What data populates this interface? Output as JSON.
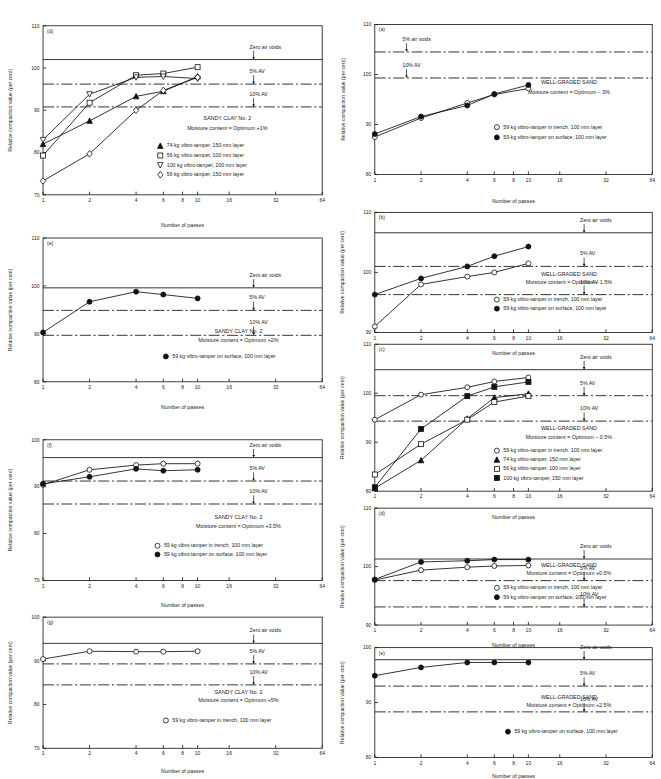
{
  "figure": {
    "axis_labels": {
      "x": "Number of passes",
      "y": "Relative compaction value (per cent)"
    },
    "xticks": [
      "1",
      "2",
      "4",
      "6",
      "8",
      "10",
      "16",
      "32",
      "64"
    ],
    "annotations": {
      "zero_air_voids": "Zero air voids",
      "five_pct_av": "5% AV",
      "ten_pct_av": "10% AV",
      "five_pct_air_voids": "5% air voids"
    },
    "legend_labels": {
      "trench59": "59 kg vibro-tamper in trench, 100 mm layer",
      "surface59": "59 kg vibro-tamper on surface, 100 mm layer",
      "t74": "74 kg vibro-tamper, 150 mm layer",
      "t56_100": "56 kg vibro-tamper, 100 mm layer",
      "t56_150": "56 kg vibro-tamper, 150 mm layer",
      "t100_200": "100 kg vibro-tamper, 200 mm layer",
      "t100_150": "100 kg vibro-tamper, 150 mm layer"
    }
  },
  "chart_data": [
    {
      "id": "left-d",
      "type": "line",
      "panel_label": "(d)",
      "column": "left",
      "title": "SANDY CLAY No. 2",
      "subtitle": "Moisture content = Optimum +1%",
      "xlabel": "Number of passes",
      "ylabel": "Relative compaction value (per cent)",
      "xscale": "log",
      "xlim": [
        1,
        64
      ],
      "xticks": [
        "1",
        "2",
        "4",
        "6",
        "8",
        "10",
        "16",
        "32",
        "64"
      ],
      "ylim": [
        70,
        110
      ],
      "yticks": [
        70,
        80,
        90,
        100,
        110
      ],
      "ref_lines": [
        {
          "label": "Zero air voids",
          "value": 102.0,
          "style": "solid"
        },
        {
          "label": "5% AV",
          "value": 96.2,
          "style": "dashdot"
        },
        {
          "label": "10% AV",
          "value": 90.8,
          "style": "dashdot"
        }
      ],
      "series": [
        {
          "name": "74 kg vibro-tamper, 150 mm layer",
          "marker": "triangle-filled",
          "x": [
            1,
            2,
            4,
            6,
            10
          ],
          "values": [
            82.0,
            87.5,
            93.3,
            94.5,
            98.0
          ]
        },
        {
          "name": "56 kg vibro-tamper, 100 mm layer",
          "marker": "square-open",
          "x": [
            1,
            2,
            4,
            6,
            10
          ],
          "values": [
            79.3,
            91.8,
            98.3,
            98.7,
            100.2
          ]
        },
        {
          "name": "100 kg vibro-tamper, 200 mm layer",
          "marker": "triangle-down-open",
          "x": [
            1,
            2,
            4,
            6,
            10
          ],
          "values": [
            83.0,
            93.8,
            97.8,
            98.0,
            97.5
          ]
        },
        {
          "name": "56 kg vibro-tamper, 150 mm layer",
          "marker": "diamond-open",
          "x": [
            1,
            2,
            4,
            6,
            10
          ],
          "values": [
            73.3,
            79.7,
            90.0,
            94.7,
            97.8
          ]
        }
      ]
    },
    {
      "id": "left-e",
      "type": "line",
      "panel_label": "(e)",
      "column": "left",
      "title": "SANDY CLAY No. 2",
      "subtitle": "Moisture content = Optimum +2%",
      "xlabel": "Number of passes",
      "ylabel": "Relative compaction value (per cent)",
      "xscale": "log",
      "xlim": [
        1,
        64
      ],
      "xticks": [
        "1",
        "2",
        "4",
        "6",
        "8",
        "10",
        "16",
        "32",
        "64"
      ],
      "ylim": [
        80,
        110
      ],
      "yticks": [
        80,
        90,
        100,
        110
      ],
      "ref_lines": [
        {
          "label": "Zero air voids",
          "value": 99.6,
          "style": "solid"
        },
        {
          "label": "5% AV",
          "value": 94.9,
          "style": "dashdot"
        },
        {
          "label": "10% AV",
          "value": 89.7,
          "style": "dashdot"
        }
      ],
      "series": [
        {
          "name": "59 kg vibro-tamper on surface, 100 mm layer",
          "marker": "circle-filled",
          "x": [
            1,
            2,
            4,
            6,
            10
          ],
          "values": [
            90.3,
            96.7,
            98.8,
            98.2,
            97.4
          ]
        }
      ]
    },
    {
      "id": "left-f",
      "type": "line",
      "panel_label": "(f)",
      "column": "left",
      "title": "SANDY CLAY No. 2",
      "subtitle": "Moisture content = Optimum +3.5%",
      "xlabel": "Number of passes",
      "ylabel": "Relative compaction value (per cent)",
      "xscale": "log",
      "xlim": [
        1,
        64
      ],
      "xticks": [
        "1",
        "2",
        "4",
        "6",
        "8",
        "10",
        "16",
        "32",
        "64"
      ],
      "ylim": [
        70,
        100
      ],
      "yticks": [
        70,
        80,
        90,
        100
      ],
      "ref_lines": [
        {
          "label": "Zero air voids",
          "value": 96.2,
          "style": "solid"
        },
        {
          "label": "5% AV",
          "value": 91.2,
          "style": "dashdot"
        },
        {
          "label": "10% AV",
          "value": 86.3,
          "style": "dashdot"
        }
      ],
      "series": [
        {
          "name": "59 kg vibro-tamper in trench, 100 mm layer",
          "marker": "circle-open",
          "x": [
            1,
            2,
            4,
            6,
            10
          ],
          "values": [
            90.4,
            93.6,
            94.6,
            94.9,
            94.9
          ]
        },
        {
          "name": "59 kg vibro-tamper on surface, 100 mm layer",
          "marker": "circle-filled",
          "x": [
            1,
            2,
            4,
            6,
            10
          ],
          "values": [
            90.6,
            92.1,
            93.8,
            93.4,
            93.6
          ]
        }
      ]
    },
    {
      "id": "left-g",
      "type": "line",
      "panel_label": "(g)",
      "column": "left",
      "title": "SANDY CLAY No. 2",
      "subtitle": "Moisture content = Optimum +5%",
      "xlabel": "Number of passes",
      "ylabel": "Relative compaction value (per cent)",
      "xscale": "log",
      "xlim": [
        1,
        64
      ],
      "xticks": [
        "1",
        "2",
        "4",
        "6",
        "8",
        "10",
        "16",
        "32",
        "64"
      ],
      "ylim": [
        70,
        100
      ],
      "yticks": [
        70,
        80,
        90,
        100
      ],
      "ref_lines": [
        {
          "label": "Zero air voids",
          "value": 94.0,
          "style": "solid"
        },
        {
          "label": "5% AV",
          "value": 89.3,
          "style": "dashdot"
        },
        {
          "label": "10% AV",
          "value": 84.5,
          "style": "dashdot"
        }
      ],
      "series": [
        {
          "name": "59 kg vibro-tamper in trench, 100 mm layer",
          "marker": "circle-open",
          "x": [
            1,
            2,
            4,
            6,
            10
          ],
          "values": [
            90.4,
            92.2,
            92.1,
            92.1,
            92.2
          ]
        }
      ]
    },
    {
      "id": "right-a",
      "type": "line",
      "panel_label": "(a)",
      "column": "right",
      "title": "WELL-GRADED SAND",
      "subtitle": "Moisture content = Optimum − 3%",
      "xlabel": "Number of passes",
      "ylabel": "Relative compaction value (per cent)",
      "xscale": "log",
      "xlim": [
        1,
        64
      ],
      "xticks": [
        "1",
        "2",
        "4",
        "6",
        "8",
        "10",
        "16",
        "32",
        "64"
      ],
      "ylim": [
        80,
        110
      ],
      "yticks": [
        80,
        90,
        100,
        110
      ],
      "ref_lines": [
        {
          "label": "5% air voids",
          "value": 104.5,
          "style": "dashdot"
        },
        {
          "label": "10% AV",
          "value": 99.3,
          "style": "dashdot"
        }
      ],
      "series": [
        {
          "name": "59 kg vibro-tamper in trench, 100 mm layer",
          "marker": "circle-open",
          "x": [
            1,
            2,
            4,
            6,
            10
          ],
          "values": [
            87.5,
            91.3,
            94.3,
            96.0,
            97.2
          ]
        },
        {
          "name": "59 kg vibro-tamper on surface, 100 mm layer",
          "marker": "circle-filled",
          "x": [
            1,
            2,
            4,
            6,
            10
          ],
          "values": [
            88.1,
            91.6,
            93.8,
            96.1,
            97.9
          ]
        }
      ]
    },
    {
      "id": "right-b",
      "type": "line",
      "panel_label": "(b)",
      "column": "right",
      "title": "WELL-GRADED SAND",
      "subtitle": "Moisture content = Optimum − 1.5%",
      "xlabel": "Number of passes",
      "ylabel": "Relative compaction value (per cent)",
      "xscale": "log",
      "xlim": [
        1,
        64
      ],
      "xticks": [
        "1",
        "2",
        "4",
        "6",
        "8",
        "10",
        "16",
        "32",
        "64"
      ],
      "ylim": [
        90,
        110
      ],
      "yticks": [
        90,
        100,
        110
      ],
      "ref_lines": [
        {
          "label": "Zero air voids",
          "value": 106.6,
          "style": "solid"
        },
        {
          "label": "5% AV",
          "value": 101.0,
          "style": "dashdot"
        },
        {
          "label": "10% AV",
          "value": 96.3,
          "style": "dashdot"
        }
      ],
      "series": [
        {
          "name": "59 kg vibro-tamper in trench, 100 mm layer",
          "marker": "circle-open",
          "x": [
            1,
            2,
            4,
            6,
            10
          ],
          "values": [
            91.0,
            98.0,
            99.3,
            100.0,
            101.5
          ]
        },
        {
          "name": "59 kg vibro-tamper on surface, 100 mm layer",
          "marker": "circle-filled",
          "x": [
            1,
            2,
            4,
            6,
            10
          ],
          "values": [
            96.3,
            99.0,
            101.0,
            102.7,
            104.3
          ]
        }
      ]
    },
    {
      "id": "right-c",
      "type": "line",
      "panel_label": "(c)",
      "column": "right",
      "title": "WELL-GRADED SAND",
      "subtitle": "Moisture content = Optimum − 0.5%",
      "xlabel": "Number of passes",
      "ylabel": "Relative compaction value (per cent)",
      "xscale": "log",
      "xlim": [
        1,
        64
      ],
      "xticks": [
        "1",
        "2",
        "4",
        "6",
        "8",
        "10",
        "16",
        "32",
        "64"
      ],
      "ylim": [
        80,
        110
      ],
      "yticks": [
        80,
        90,
        100,
        110
      ],
      "ref_lines": [
        {
          "label": "Zero air voids",
          "value": 104.8,
          "style": "solid"
        },
        {
          "label": "5% AV",
          "value": 99.5,
          "style": "dashdot"
        },
        {
          "label": "10% AV",
          "value": 94.3,
          "style": "dashdot"
        }
      ],
      "series": [
        {
          "name": "59 kg vibro-tamper in trench, 100 mm layer",
          "marker": "circle-open",
          "x": [
            1,
            2,
            4,
            6,
            10
          ],
          "values": [
            94.6,
            99.7,
            101.2,
            102.4,
            103.2
          ]
        },
        {
          "name": "74 kg vibro-tamper, 150 mm layer",
          "marker": "triangle-filled",
          "x": [
            1,
            2,
            4,
            6,
            10
          ],
          "values": [
            80.6,
            86.3,
            94.8,
            99.1,
            99.9
          ]
        },
        {
          "name": "56 kg vibro-tamper, 100 mm layer",
          "marker": "square-open",
          "x": [
            1,
            2,
            4,
            6,
            10
          ],
          "values": [
            83.4,
            89.6,
            94.6,
            98.2,
            99.4
          ]
        },
        {
          "name": "100 kg vibro-tamper, 150 mm layer",
          "marker": "square-filled",
          "x": [
            1,
            2,
            4,
            6,
            10
          ],
          "values": [
            80.8,
            92.7,
            99.4,
            101.3,
            102.3
          ]
        }
      ]
    },
    {
      "id": "right-d",
      "type": "line",
      "panel_label": "(d)",
      "column": "right",
      "title": "WELL-GRADED SAND",
      "subtitle": "Moisture content = Optimum +0.5%",
      "xlabel": "Number of passes",
      "ylabel": "Relative compaction value (per cent)",
      "xscale": "log",
      "xlim": [
        1,
        64
      ],
      "xticks": [
        "1",
        "2",
        "4",
        "6",
        "8",
        "10",
        "16",
        "32",
        "64"
      ],
      "ylim": [
        90,
        110
      ],
      "yticks": [
        90,
        100,
        110
      ],
      "ref_lines": [
        {
          "label": "Zero air voids",
          "value": 101.3,
          "style": "solid"
        },
        {
          "label": "5% AV",
          "value": 97.6,
          "style": "dashdot"
        },
        {
          "label": "10% AV",
          "value": 93.1,
          "style": "dashdot"
        }
      ],
      "series": [
        {
          "name": "59 kg vibro-tamper in trench, 100 mm layer",
          "marker": "circle-open",
          "x": [
            1,
            2,
            4,
            6,
            10
          ],
          "values": [
            97.7,
            99.4,
            99.9,
            100.1,
            100.2
          ]
        },
        {
          "name": "59 kg vibro-tamper on surface, 100 mm layer",
          "marker": "circle-filled",
          "x": [
            1,
            2,
            4,
            6,
            10
          ],
          "values": [
            97.8,
            100.8,
            101.0,
            101.2,
            101.2
          ]
        }
      ]
    },
    {
      "id": "right-e",
      "type": "line",
      "panel_label": "(e)",
      "column": "right",
      "title": "WELL-GRADED SAND",
      "subtitle": "Moisture content = Optimum +2.5%",
      "xlabel": "Number of passes",
      "ylabel": "Relative compaction value (per cent)",
      "xscale": "log",
      "xlim": [
        1,
        64
      ],
      "xticks": [
        "1",
        "2",
        "4",
        "6",
        "8",
        "10",
        "16",
        "32",
        "64"
      ],
      "ylim": [
        80,
        100
      ],
      "yticks": [
        80,
        90,
        100
      ],
      "ref_lines": [
        {
          "label": "Zero air voids",
          "value": 97.8,
          "style": "solid"
        },
        {
          "label": "5% AV",
          "value": 93.0,
          "style": "dashdot"
        },
        {
          "label": "10% AV",
          "value": 88.3,
          "style": "dashdot"
        }
      ],
      "series": [
        {
          "name": "59 kg vibro-tamper on surface, 100 mm layer",
          "marker": "circle-filled",
          "x": [
            1,
            2,
            4,
            6,
            10
          ],
          "values": [
            94.9,
            96.4,
            97.3,
            97.3,
            97.3
          ]
        }
      ]
    }
  ],
  "panel_geometry": [
    {
      "id": "left-d",
      "x": 6,
      "y": 14,
      "w": 322,
      "h": 214,
      "title_xy": [
        0.66,
        0.56
      ],
      "sub_xy": [
        0.66,
        0.615
      ],
      "legend_xy": [
        0.42,
        0.72
      ],
      "legend_dy": 0.057,
      "ann_x": 0.74,
      "arrow_dx": -0.008
    },
    {
      "id": "left-e",
      "x": 6,
      "y": 228,
      "w": 322,
      "h": 182,
      "title_xy": [
        0.7,
        0.66
      ],
      "sub_xy": [
        0.7,
        0.725
      ],
      "legend_xy": [
        0.44,
        0.835
      ],
      "legend_dy": 0.062,
      "ann_x": 0.74,
      "arrow_dx": -0.008
    },
    {
      "id": "left-f",
      "x": 6,
      "y": 430,
      "w": 322,
      "h": 178,
      "title_xy": [
        0.7,
        0.565
      ],
      "sub_xy": [
        0.7,
        0.625
      ],
      "legend_xy": [
        0.41,
        0.765
      ],
      "legend_dy": 0.062,
      "ann_x": 0.74,
      "arrow_dx": -0.008
    },
    {
      "id": "left-g",
      "x": 6,
      "y": 608,
      "w": 322,
      "h": 166,
      "title_xy": [
        0.7,
        0.585
      ],
      "sub_xy": [
        0.7,
        0.65
      ],
      "legend_xy": [
        0.44,
        0.8
      ],
      "legend_dy": 0.062,
      "ann_x": 0.74,
      "arrow_dx": -0.008
    },
    {
      "id": "right-a",
      "x": 338,
      "y": 14,
      "w": 320,
      "h": 190,
      "title_xy": [
        0.7,
        0.4
      ],
      "sub_xy": [
        0.7,
        0.465
      ],
      "legend_xy": [
        0.44,
        0.695
      ],
      "legend_dy": 0.068,
      "ann_x": 0.1,
      "arrow_dx": 0.0
    },
    {
      "id": "right-b",
      "x": 338,
      "y": 204,
      "w": 320,
      "h": 152,
      "title_xy": [
        0.7,
        0.53
      ],
      "sub_xy": [
        0.7,
        0.6
      ],
      "legend_xy": [
        0.44,
        0.74
      ],
      "legend_dy": 0.075,
      "ann_x": 0.74,
      "arrow_dx": -0.008
    },
    {
      "id": "right-c",
      "x": 338,
      "y": 334,
      "w": 320,
      "h": 186,
      "title_xy": [
        0.7,
        0.585
      ],
      "sub_xy": [
        0.7,
        0.645
      ],
      "legend_xy": [
        0.44,
        0.735
      ],
      "legend_dy": 0.062,
      "ann_x": 0.74,
      "arrow_dx": -0.008
    },
    {
      "id": "right-d",
      "x": 338,
      "y": 500,
      "w": 320,
      "h": 148,
      "title_xy": [
        0.7,
        0.5
      ],
      "sub_xy": [
        0.7,
        0.575
      ],
      "legend_xy": [
        0.44,
        0.695
      ],
      "legend_dy": 0.08,
      "ann_x": 0.74,
      "arrow_dx": -0.008
    },
    {
      "id": "right-e",
      "x": 338,
      "y": 640,
      "w": 320,
      "h": 139,
      "title_xy": [
        0.7,
        0.47
      ],
      "sub_xy": [
        0.7,
        0.545
      ],
      "legend_xy": [
        0.48,
        0.78
      ],
      "legend_dy": 0.08,
      "ann_x": 0.74,
      "arrow_dx": -0.008
    }
  ]
}
